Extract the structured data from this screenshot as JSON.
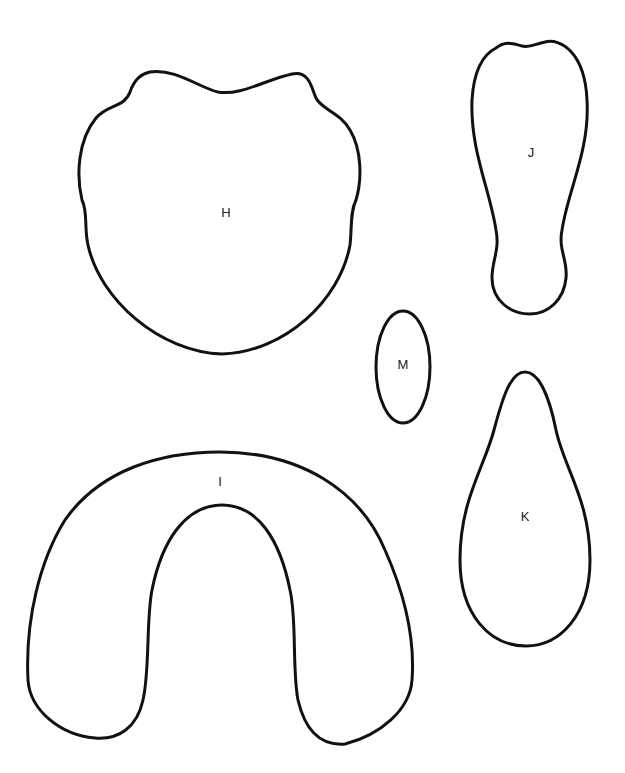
{
  "page": {
    "background": "#ffffff",
    "stroke_color": "#111111"
  },
  "shapes": [
    {
      "id": "H",
      "label": "H",
      "description": "rounded shield / apple shape with two top bumps"
    },
    {
      "id": "J",
      "label": "J",
      "description": "elongated foot / peanut shape"
    },
    {
      "id": "M",
      "label": "M",
      "description": "small vertical oval"
    },
    {
      "id": "K",
      "label": "K",
      "description": "teardrop shape, narrow at top"
    },
    {
      "id": "I",
      "label": "I",
      "description": "horseshoe / arch shape"
    }
  ]
}
